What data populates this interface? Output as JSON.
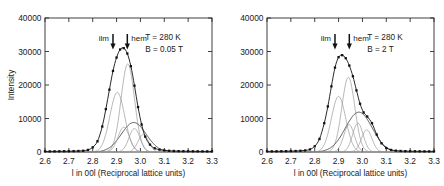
{
  "figure": {
    "background": "#ffffff",
    "panel_count": 2
  },
  "axes": {
    "x": {
      "label": "l in 00l (Reciprocal lattice units)",
      "min": 2.6,
      "max": 3.3,
      "ticks": [
        2.6,
        2.7,
        2.8,
        2.9,
        3.0,
        3.1,
        3.2,
        3.3
      ],
      "tick_labels": [
        "2.6",
        "2.7",
        "2.8",
        "2.9",
        "3.0",
        "3.1",
        "3.2",
        "3.3"
      ]
    },
    "y": {
      "label": "Intensity",
      "min": 0,
      "max": 40000,
      "ticks": [
        0,
        10000,
        20000,
        30000,
        40000
      ],
      "tick_labels": [
        "0",
        "10000",
        "20000",
        "30000",
        "40000"
      ]
    }
  },
  "markers": {
    "ilm_label": "ilm",
    "hem_label": "hem",
    "ilm_position": 2.885,
    "hem_position": 2.945
  },
  "chart_data": [
    {
      "type": "line",
      "panel": "left",
      "title": "",
      "xlabel": "l in 00l (Reciprocal lattice units)",
      "ylabel": "Intensity",
      "xlim": [
        2.6,
        3.3
      ],
      "ylim": [
        0,
        40000
      ],
      "grid": false,
      "legend": false,
      "annotations": [
        "T = 280 K",
        "B = 0.05 T"
      ],
      "temperature": "T = 280 K",
      "field": "B = 0.05 T",
      "series": [
        {
          "name": "measured",
          "style": "markers+line",
          "color": "#111111",
          "x": [
            2.6,
            2.62,
            2.64,
            2.66,
            2.68,
            2.7,
            2.72,
            2.74,
            2.76,
            2.78,
            2.8,
            2.82,
            2.84,
            2.855,
            2.87,
            2.885,
            2.9,
            2.915,
            2.93,
            2.945,
            2.96,
            2.975,
            2.99,
            3.005,
            3.02,
            3.04,
            3.06,
            3.08,
            3.1,
            3.12,
            3.14,
            3.16,
            3.18,
            3.2,
            3.22,
            3.24,
            3.26,
            3.28,
            3.3
          ],
          "y": [
            180,
            180,
            200,
            210,
            220,
            240,
            260,
            300,
            380,
            620,
            1400,
            3200,
            7600,
            12800,
            18600,
            24200,
            28200,
            30600,
            31000,
            29400,
            25600,
            19800,
            13400,
            8200,
            4600,
            2200,
            1100,
            700,
            480,
            360,
            300,
            260,
            240,
            220,
            210,
            200,
            190,
            185,
            180
          ]
        },
        {
          "name": "ilm-sharp-component",
          "style": "line",
          "color": "#9a9a9a",
          "center": 2.903,
          "amplitude": 17800,
          "width": 0.031
        },
        {
          "name": "hem-sharp-component",
          "style": "line",
          "color": "#9a9a9a",
          "center": 2.947,
          "amplitude": 26300,
          "width": 0.028
        },
        {
          "name": "broad-envelope",
          "style": "line",
          "color": "#4a4a4a",
          "center": 2.972,
          "amplitude": 8800,
          "width": 0.052
        },
        {
          "name": "broad-sub-a",
          "style": "line",
          "color": "#b0b0b0",
          "center": 2.93,
          "amplitude": 7400,
          "width": 0.024
        },
        {
          "name": "broad-sub-b",
          "style": "line",
          "color": "#b0b0b0",
          "center": 2.975,
          "amplitude": 7000,
          "width": 0.023
        },
        {
          "name": "broad-sub-c",
          "style": "line",
          "color": "#b0b0b0",
          "center": 3.012,
          "amplitude": 5200,
          "width": 0.022
        }
      ]
    },
    {
      "type": "line",
      "panel": "right",
      "title": "",
      "xlabel": "l in 00l (Reciprocal lattice units)",
      "ylabel": "",
      "xlim": [
        2.6,
        3.3
      ],
      "ylim": [
        0,
        40000
      ],
      "grid": false,
      "legend": false,
      "annotations": [
        "T = 280 K",
        "B = 2 T"
      ],
      "temperature": "T = 280 K",
      "field": "B = 2 T",
      "series": [
        {
          "name": "measured",
          "style": "markers+line",
          "color": "#111111",
          "x": [
            2.6,
            2.62,
            2.64,
            2.66,
            2.68,
            2.7,
            2.72,
            2.74,
            2.76,
            2.78,
            2.8,
            2.82,
            2.84,
            2.855,
            2.87,
            2.885,
            2.9,
            2.915,
            2.93,
            2.945,
            2.96,
            2.975,
            2.99,
            3.005,
            3.02,
            3.04,
            3.06,
            3.08,
            3.1,
            3.12,
            3.14,
            3.16,
            3.18,
            3.2,
            3.22,
            3.24,
            3.26,
            3.28,
            3.3
          ],
          "y": [
            190,
            195,
            210,
            225,
            245,
            270,
            300,
            360,
            470,
            760,
            1700,
            3900,
            8600,
            13600,
            19600,
            25200,
            28300,
            28900,
            28000,
            25800,
            22600,
            18400,
            14400,
            11800,
            10600,
            8600,
            5200,
            2600,
            1200,
            620,
            400,
            300,
            260,
            235,
            215,
            205,
            195,
            190,
            185
          ]
        },
        {
          "name": "ilm-sharp-component",
          "style": "line",
          "color": "#9a9a9a",
          "center": 2.9,
          "amplitude": 16600,
          "width": 0.03
        },
        {
          "name": "hem-sharp-component",
          "style": "line",
          "color": "#9a9a9a",
          "center": 2.941,
          "amplitude": 22300,
          "width": 0.027
        },
        {
          "name": "broad-envelope",
          "style": "line",
          "color": "#4a4a4a",
          "center": 2.985,
          "amplitude": 11900,
          "width": 0.056
        },
        {
          "name": "broad-sub-a",
          "style": "line",
          "color": "#b0b0b0",
          "center": 2.944,
          "amplitude": 8200,
          "width": 0.022
        },
        {
          "name": "broad-sub-b",
          "style": "line",
          "color": "#b0b0b0",
          "center": 2.981,
          "amplitude": 8600,
          "width": 0.022
        },
        {
          "name": "broad-sub-c",
          "style": "line",
          "color": "#b0b0b0",
          "center": 3.018,
          "amplitude": 6600,
          "width": 0.022
        }
      ]
    }
  ]
}
